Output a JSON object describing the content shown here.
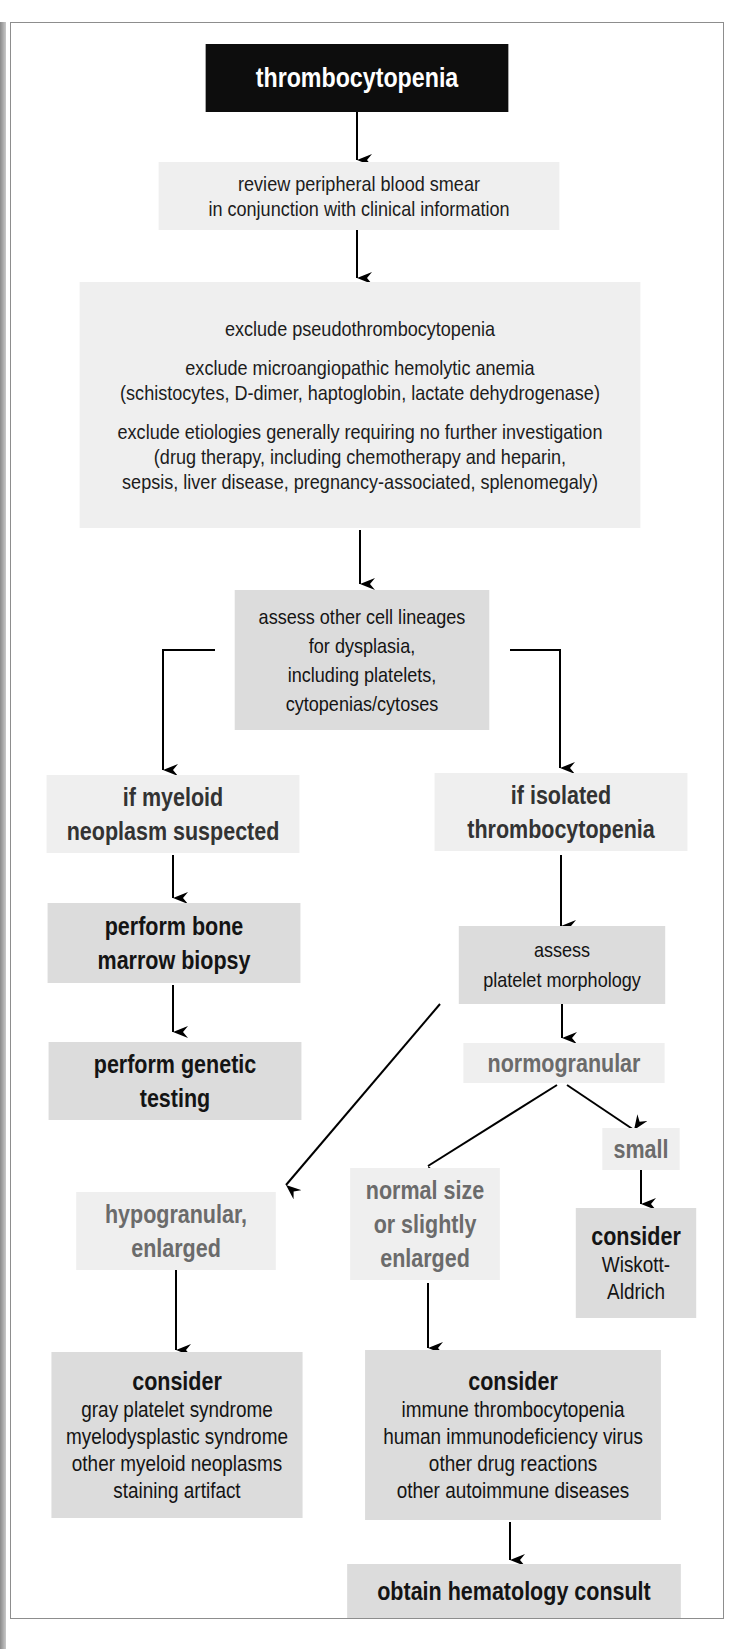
{
  "diagram": {
    "title": "thrombocytopenia",
    "nodes": {
      "review": [
        "review peripheral blood smear",
        "in conjunction with clinical information"
      ],
      "exclude": {
        "line1": "exclude pseudothrombocytopenia",
        "line2a": "exclude microangiopathic hemolytic anemia",
        "line2b": "(schistocytes, D-dimer, haptoglobin, lactate dehydrogenase)",
        "line3a": "exclude etiologies generally requiring no further investigation",
        "line3b": "(drug therapy, including chemotherapy and heparin,",
        "line3c": "sepsis, liver disease, pregnancy-associated, splenomegaly)"
      },
      "assess_lineages": [
        "assess other cell lineages",
        "for dysplasia,",
        "including platelets,",
        "cytopenias/cytoses"
      ],
      "myeloid": [
        "if myeloid",
        "neoplasm suspected"
      ],
      "isolated": [
        "if isolated",
        "thrombocytopenia"
      ],
      "bone_marrow": [
        "perform bone",
        "marrow biopsy"
      ],
      "genetic": [
        "perform genetic",
        "testing"
      ],
      "assess_platelet": [
        "assess",
        "platelet morphology"
      ],
      "normogranular": "normogranular",
      "small": "small",
      "hypogranular": [
        "hypogranular,",
        "enlarged"
      ],
      "normal_size": [
        "normal size",
        "or slightly",
        "enlarged"
      ],
      "wiskott": {
        "header": "consider",
        "lines": [
          "Wiskott-",
          "Aldrich"
        ]
      },
      "consider_left": {
        "header": "consider",
        "lines": [
          "gray platelet syndrome",
          "myelodysplastic syndrome",
          "other myeloid neoplasms",
          "staining artifact"
        ]
      },
      "consider_right": {
        "header": "consider",
        "lines": [
          "immune thrombocytopenia",
          "human immunodeficiency virus",
          "other drug reactions",
          "other autoimmune diseases"
        ]
      },
      "consult": "obtain hematology consult"
    },
    "colors": {
      "title_bg": "#0d0d0d",
      "light_box": "#efefef",
      "mid_box": "#dcdcdc",
      "grey_text": "#6b6b6b"
    }
  }
}
